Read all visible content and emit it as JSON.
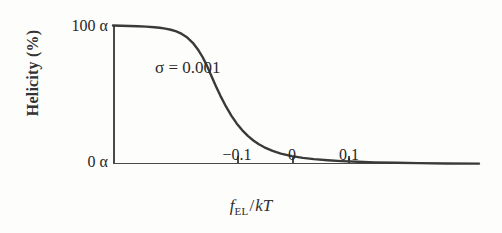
{
  "figure": {
    "background_color": "#fdfdfc",
    "axis_color": "#4a4a4a",
    "curve_color": "#3a3a3a"
  },
  "yaxis": {
    "label": "Helicity (%)",
    "tick_top": "100 α",
    "tick_bottom": "0 α"
  },
  "xaxis": {
    "label_f": "f",
    "label_sub": "EL",
    "label_slash": "/",
    "label_kT": "kT",
    "ticks": [
      "−0.1",
      "0",
      "0.1"
    ]
  },
  "annotation": {
    "text": "σ = 0.001"
  },
  "chart_data": {
    "type": "line",
    "title": "",
    "subtitle": "",
    "xlabel": "f_EL/kT",
    "ylabel": "Helicity (%)",
    "xlim": [
      -0.175,
      0.49
    ],
    "ylim": [
      0,
      100
    ],
    "ytick_labels": [
      "0 α",
      "100 α"
    ],
    "ytick_values": [
      0,
      100
    ],
    "xtick_labels": [
      "−0.1",
      "0",
      "0.1"
    ],
    "xtick_values": [
      -0.1,
      0,
      0.1
    ],
    "grid": false,
    "legend": null,
    "annotations": [
      {
        "text": "σ = 0.001",
        "x": -0.045,
        "y": 74
      }
    ],
    "series": [
      {
        "name": "σ = 0.001",
        "color": "#3a3a3a",
        "x": [
          -0.175,
          -0.16,
          -0.145,
          -0.13,
          -0.115,
          -0.1,
          -0.09,
          -0.08,
          -0.07,
          -0.06,
          -0.05,
          -0.04,
          -0.03,
          -0.02,
          -0.012,
          -0.004,
          0.004,
          0.012,
          0.02,
          0.03,
          0.04,
          0.05,
          0.06,
          0.07,
          0.08,
          0.09,
          0.1,
          0.115,
          0.13,
          0.15,
          0.17,
          0.19,
          0.215,
          0.24,
          0.27,
          0.3,
          0.34,
          0.38,
          0.43,
          0.49
        ],
        "y": [
          99.6,
          99.5,
          99.3,
          99.1,
          98.8,
          98.4,
          98.0,
          97.4,
          96.6,
          95.4,
          93.6,
          91.0,
          87.2,
          82.0,
          76.8,
          70.4,
          63.2,
          56.0,
          49.2,
          41.6,
          34.8,
          29.0,
          24.2,
          20.2,
          16.9,
          14.2,
          12.0,
          9.4,
          7.5,
          5.7,
          4.4,
          3.5,
          2.7,
          2.1,
          1.6,
          1.2,
          0.9,
          0.6,
          0.4,
          0.3
        ]
      }
    ]
  }
}
